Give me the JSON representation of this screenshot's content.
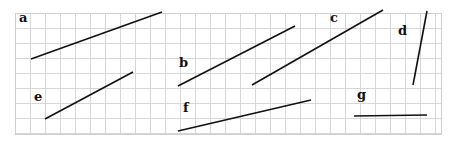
{
  "grid": {
    "x": 15,
    "y": 13,
    "width": 426,
    "height": 121,
    "cell": 15,
    "line_color": "#d6d6d6",
    "border_color": "#cfcfcf"
  },
  "segment_color": "#111111",
  "segments": [
    {
      "id": "a",
      "label": "a",
      "label_pos": [
        19,
        22
      ],
      "x1": 31,
      "y1": 59,
      "x2": 162,
      "y2": 12
    },
    {
      "id": "b",
      "label": "b",
      "label_pos": [
        179,
        67
      ],
      "x1": 178,
      "y1": 86,
      "x2": 295,
      "y2": 26
    },
    {
      "id": "c",
      "label": "c",
      "label_pos": [
        330,
        22
      ],
      "x1": 252,
      "y1": 85,
      "x2": 383,
      "y2": 10
    },
    {
      "id": "d",
      "label": "d",
      "label_pos": [
        398,
        35
      ],
      "x1": 427,
      "y1": 11,
      "x2": 413,
      "y2": 85
    },
    {
      "id": "e",
      "label": "e",
      "label_pos": [
        34,
        101
      ],
      "x1": 45,
      "y1": 119,
      "x2": 133,
      "y2": 72
    },
    {
      "id": "f",
      "label": "f",
      "label_pos": [
        183,
        112
      ],
      "x1": 178,
      "y1": 131,
      "x2": 311,
      "y2": 100
    },
    {
      "id": "g",
      "label": "g",
      "label_pos": [
        357,
        99
      ],
      "x1": 354,
      "y1": 116,
      "x2": 427,
      "y2": 115
    }
  ]
}
